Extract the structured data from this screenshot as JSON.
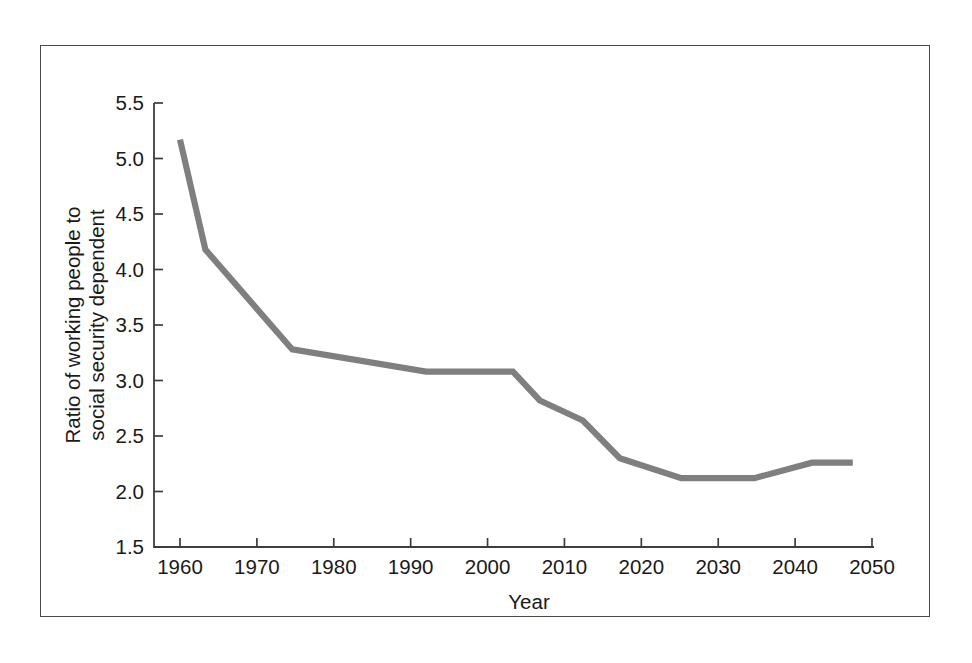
{
  "figure": {
    "background_color": "#ffffff",
    "frame_color": "#4a4a4a"
  },
  "chart_data": {
    "type": "line",
    "title": "",
    "subtitle": "",
    "xlabel": "Year",
    "ylabel": "Ratio of working people to social security dependent",
    "ylabel_line1": "Ratio of working people to",
    "ylabel_line2": "social security dependent",
    "xlim": [
      1958,
      2051
    ],
    "ylim": [
      1.5,
      5.5
    ],
    "xticks": [
      1960,
      1970,
      1980,
      1990,
      2000,
      2010,
      2020,
      2030,
      2040,
      2050
    ],
    "xtick_labels": [
      "1960",
      "1970",
      "1980",
      "1990",
      "2000",
      "2010",
      "2020",
      "2030",
      "2040",
      "2050"
    ],
    "yticks": [
      1.5,
      2.0,
      2.5,
      3.0,
      3.5,
      4.0,
      4.5,
      5.0,
      5.5
    ],
    "ytick_labels": [
      "1.5",
      "2.0",
      "2.5",
      "3.0",
      "3.5",
      "4.0",
      "4.5",
      "5.0",
      "5.5"
    ],
    "grid": false,
    "legend": null,
    "annotations": [],
    "series": [
      {
        "name": "Ratio of working people to social security dependent",
        "color": "#7f7f7f",
        "linewidth": 6.2,
        "x": [
          1960.0,
          1963.3,
          1974.6,
          1992.0,
          2003.3,
          2006.8,
          2012.4,
          2017.2,
          2025.2,
          2034.7,
          2042.2,
          2047.5
        ],
        "y": [
          5.17,
          4.18,
          3.28,
          3.08,
          3.08,
          2.82,
          2.64,
          2.3,
          2.12,
          2.12,
          2.26,
          2.26
        ]
      }
    ]
  }
}
